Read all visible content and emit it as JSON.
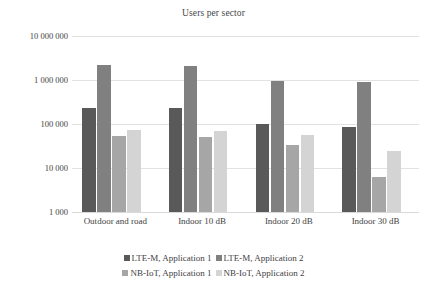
{
  "chart_data": {
    "type": "bar",
    "title": "Users per sector",
    "xlabel": "",
    "ylabel": "",
    "scale": "log",
    "ylim": [
      1000,
      10000000
    ],
    "grid": true,
    "legend_position": "bottom",
    "categories": [
      "Outdoor and road",
      "Indoor 10 dB",
      "Indoor 20 dB",
      "Indoor 30 dB"
    ],
    "y_ticks": [
      1000,
      10000,
      100000,
      1000000,
      10000000
    ],
    "y_tick_labels": [
      "1 000",
      "10 000",
      "100 000",
      "1 000 000",
      "10 000 000"
    ],
    "series": [
      {
        "name": "LTE-M, Application 1",
        "color": "#595959",
        "values": [
          230000,
          235000,
          98000,
          85000
        ]
      },
      {
        "name": "LTE-M, Application 2",
        "color": "#808080",
        "values": [
          2200000,
          2050000,
          960000,
          880000
        ]
      },
      {
        "name": "NB-IoT, Application 1",
        "color": "#a6a6a6",
        "values": [
          54000,
          52000,
          33000,
          6300
        ]
      },
      {
        "name": "NB-IoT, Application 2",
        "color": "#d4d4d4",
        "values": [
          72000,
          70000,
          56000,
          24000
        ]
      }
    ]
  },
  "colors": {
    "gridline": "#e2e2e2",
    "text": "#3f3f3f",
    "background": "#ffffff"
  }
}
